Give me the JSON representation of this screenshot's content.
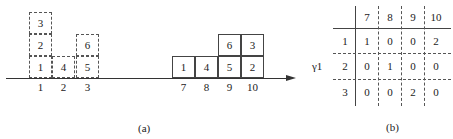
{
  "figure_a": {
    "caption": "(a)",
    "left_group": {
      "columns": [
        {
          "label": "1",
          "stack": [
            "1",
            "2",
            "3"
          ]
        },
        {
          "label": "2",
          "stack": [
            "4"
          ]
        },
        {
          "label": "3",
          "stack": [
            "5",
            "6"
          ]
        }
      ],
      "style": "dashed"
    },
    "right_group": {
      "columns": [
        {
          "label": "7",
          "stack": [
            "1"
          ]
        },
        {
          "label": "8",
          "stack": [
            "4"
          ]
        },
        {
          "label": "9",
          "stack": [
            "5",
            "6"
          ]
        },
        {
          "label": "10",
          "stack": [
            "2",
            "3"
          ]
        }
      ],
      "style": "solid"
    }
  },
  "figure_b": {
    "caption": "(b)",
    "row_axis_label": "γ1",
    "col_headers": [
      "7",
      "8",
      "9",
      "10"
    ],
    "row_headers": [
      "1",
      "2",
      "3"
    ],
    "rows": [
      [
        "1",
        "0",
        "0",
        "2"
      ],
      [
        "0",
        "1",
        "0",
        "0"
      ],
      [
        "0",
        "0",
        "2",
        "0"
      ]
    ]
  }
}
